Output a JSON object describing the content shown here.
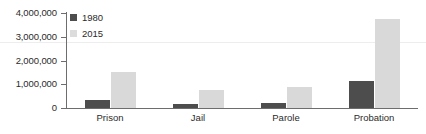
{
  "chart_data": {
    "type": "bar",
    "title": "",
    "subtitle": "",
    "xlabel": "",
    "ylabel": "",
    "categories": [
      "Prison",
      "Jail",
      "Parole",
      "Probation"
    ],
    "series": [
      {
        "name": "1980",
        "color": "#4d4d4d",
        "values": [
          330000,
          185000,
          220000,
          1150000
        ]
      },
      {
        "name": "2015",
        "color": "#d9d9d9",
        "values": [
          1520000,
          750000,
          870000,
          3750000
        ]
      }
    ],
    "ylim": [
      0,
      4000000
    ],
    "ytick_values": [
      0,
      1000000,
      2000000,
      3000000,
      4000000
    ],
    "ytick_labels": [
      "0",
      "1,000,000",
      "2,000,000",
      "3,000,000",
      "4,000,000"
    ],
    "grid": false,
    "legend_position": "top-left",
    "legend": [
      {
        "label": "1980",
        "color": "#4d4d4d"
      },
      {
        "label": "2015",
        "color": "#d9d9d9"
      }
    ]
  },
  "colors": {
    "series_1980": "#4d4d4d",
    "series_2015": "#d9d9d9",
    "axis": "#6d6d6d",
    "text": "#2b2b2b",
    "background": "#ffffff"
  }
}
